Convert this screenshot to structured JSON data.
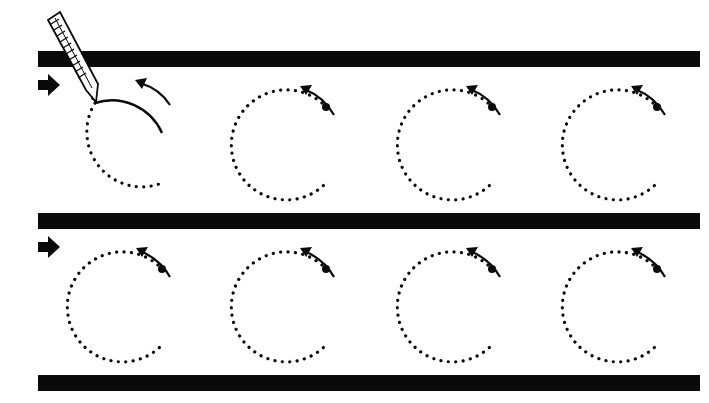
{
  "worksheet": {
    "letter": "C",
    "rows": 2,
    "letters_per_row": 4,
    "icons": [
      "pencil-icon",
      "arrow-right-icon",
      "curved-arrow-icon",
      "start-dot-icon"
    ],
    "colors": {
      "ink": "#0a0a0a",
      "paper": "#ffffff"
    }
  }
}
